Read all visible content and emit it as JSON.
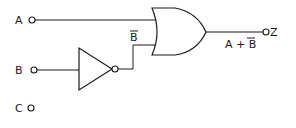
{
  "diagram": {
    "type": "logic-circuit",
    "inputs": [
      {
        "label": "A"
      },
      {
        "label": "B"
      },
      {
        "label": "C"
      }
    ],
    "output": {
      "label": "Z"
    },
    "gates": [
      {
        "type": "NOT",
        "input": "B",
        "output_label": "B"
      },
      {
        "type": "OR",
        "inputs": [
          "A",
          "NOT B"
        ]
      }
    ],
    "labels": {
      "not_output": "B",
      "or_output_expr_a": "A + ",
      "or_output_expr_b": "B"
    }
  }
}
